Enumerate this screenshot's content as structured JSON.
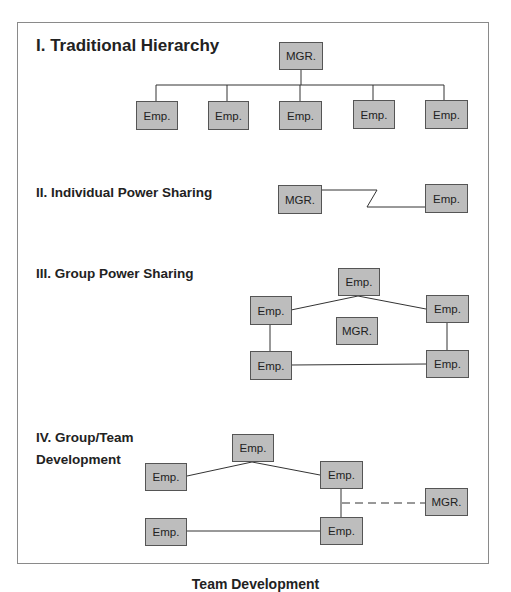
{
  "figure": {
    "caption": "Team Development",
    "colors": {
      "box_fill": "#bdbdbd",
      "box_border": "#555555",
      "line": "#333333",
      "frame": "#8a8a8a"
    }
  },
  "sections": [
    {
      "id": "traditional",
      "title": "I. Traditional Hierarchy",
      "nodes": [
        {
          "id": "m",
          "label": "MGR."
        },
        {
          "id": "e1",
          "label": "Emp."
        },
        {
          "id": "e2",
          "label": "Emp."
        },
        {
          "id": "e3",
          "label": "Emp."
        },
        {
          "id": "e4",
          "label": "Emp."
        },
        {
          "id": "e5",
          "label": "Emp."
        }
      ],
      "edges": [
        [
          "m",
          "e1",
          "tree"
        ],
        [
          "m",
          "e2",
          "tree"
        ],
        [
          "m",
          "e3",
          "tree"
        ],
        [
          "m",
          "e4",
          "tree"
        ],
        [
          "m",
          "e5",
          "tree"
        ]
      ]
    },
    {
      "id": "individual",
      "title": "II. Individual Power Sharing",
      "nodes": [
        {
          "id": "m",
          "label": "MGR."
        },
        {
          "id": "e1",
          "label": "Emp."
        }
      ],
      "edges": [
        [
          "m",
          "e1",
          "zigzag"
        ]
      ]
    },
    {
      "id": "group",
      "title": "III. Group Power Sharing",
      "nodes": [
        {
          "id": "et",
          "label": "Emp."
        },
        {
          "id": "el",
          "label": "Emp."
        },
        {
          "id": "er",
          "label": "Emp."
        },
        {
          "id": "m",
          "label": "MGR."
        },
        {
          "id": "ebl",
          "label": "Emp."
        },
        {
          "id": "ebr",
          "label": "Emp."
        }
      ],
      "edges": [
        [
          "el",
          "et",
          "solid"
        ],
        [
          "et",
          "er",
          "solid"
        ],
        [
          "el",
          "ebl",
          "solid"
        ],
        [
          "er",
          "ebr",
          "solid"
        ],
        [
          "ebl",
          "ebr",
          "solid"
        ]
      ]
    },
    {
      "id": "team",
      "title_line1": "IV. Group/Team",
      "title_line2": "Development",
      "nodes": [
        {
          "id": "et",
          "label": "Emp."
        },
        {
          "id": "el",
          "label": "Emp."
        },
        {
          "id": "er",
          "label": "Emp."
        },
        {
          "id": "m",
          "label": "MGR."
        },
        {
          "id": "ebl",
          "label": "Emp."
        },
        {
          "id": "ebr",
          "label": "Emp."
        }
      ],
      "edges": [
        [
          "el",
          "et",
          "solid"
        ],
        [
          "et",
          "er",
          "solid"
        ],
        [
          "er",
          "ebr",
          "solid"
        ],
        [
          "ebl",
          "ebr",
          "solid"
        ],
        [
          "er-ebr",
          "m",
          "dashed"
        ]
      ]
    }
  ]
}
